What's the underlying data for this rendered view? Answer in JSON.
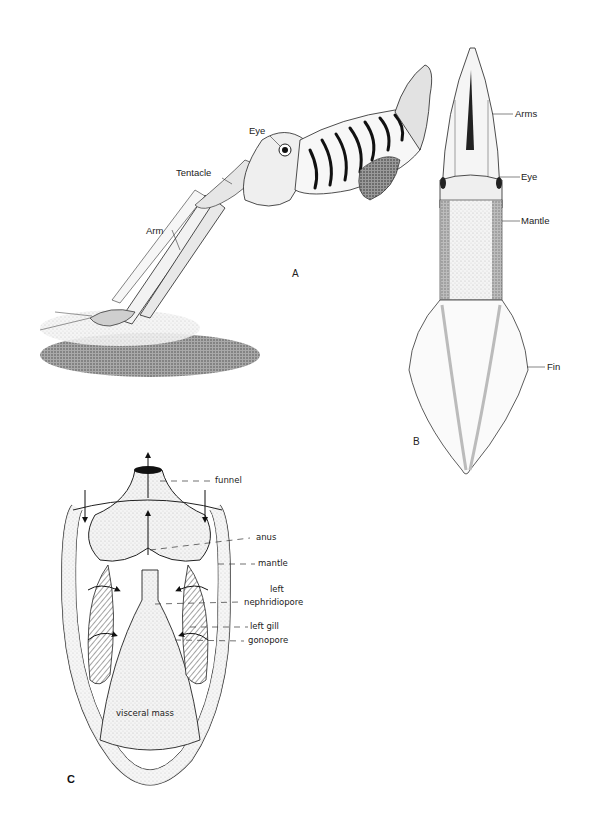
{
  "figure": {
    "panels": {
      "A": {
        "letter": "A",
        "description": "Squid (lateral view) striking at a shrimp above the seafloor",
        "labels": {
          "eye": "Eye",
          "tentacle": "Tentacle",
          "arm": "Arm"
        }
      },
      "B": {
        "letter": "B",
        "description": "Squid (dorsal view)",
        "labels": {
          "arms": "Arms",
          "eye": "Eye",
          "mantle": "Mantle",
          "fin": "Fin"
        }
      },
      "C": {
        "letter": "C",
        "description": "Mantle cavity, ventral dissection, with water-flow arrows",
        "labels": {
          "funnel": "funnel",
          "anus": "anus",
          "mantle": "mantle",
          "left_nephridiopore_1": "left",
          "left_nephridiopore_2": "nephridiopore",
          "left_gill": "left gill",
          "gonopore": "gonopore",
          "visceral_mass": "visceral mass"
        }
      }
    },
    "colors": {
      "ink": "#1a1a1a",
      "stipple": "#d9d9d9",
      "paper": "#ffffff"
    }
  }
}
